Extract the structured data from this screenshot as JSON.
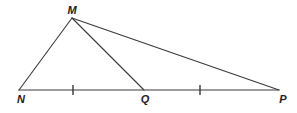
{
  "diagram": {
    "type": "triangle-geometry",
    "stroke_color": "#3a3a3a",
    "points": {
      "M": {
        "label": "M",
        "x": 72,
        "y": 18
      },
      "N": {
        "label": "N",
        "x": 19,
        "y": 90
      },
      "Q": {
        "label": "Q",
        "x": 144,
        "y": 90
      },
      "P": {
        "label": "P",
        "x": 279,
        "y": 90
      }
    },
    "segments": [
      {
        "name": "MN",
        "from": "M",
        "to": "N"
      },
      {
        "name": "MQ",
        "from": "M",
        "to": "Q"
      },
      {
        "name": "MP",
        "from": "M",
        "to": "P"
      },
      {
        "name": "NP",
        "from": "N",
        "to": "P"
      }
    ],
    "tick_marks": [
      {
        "segment": "NQ",
        "x": 73,
        "y": 90
      },
      {
        "segment": "QP",
        "x": 200,
        "y": 90
      }
    ],
    "labels": {
      "M": "M",
      "N": "N",
      "Q": "Q",
      "P": "P"
    }
  }
}
